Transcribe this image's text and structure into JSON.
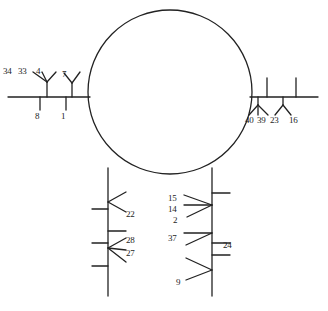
{
  "diagram": {
    "type": "schematic-line-diagram",
    "background_color": "#ffffff",
    "stroke_color": "#222222",
    "text_color": "#1d1d1d",
    "central_shape": {
      "name": "circle",
      "cx": 170,
      "cy": 92,
      "r": 82
    },
    "labels": {
      "left_branch": {
        "fork_upper": [
          "34",
          "33",
          "4"
        ],
        "fork_upper_right": "7",
        "tick_lower_left": "8",
        "tick_lower_right": "1"
      },
      "right_branch": {
        "fork_lower_left": [
          "40",
          "39",
          "23"
        ],
        "fork_lower_right": "16"
      },
      "left_stem": {
        "arrow_top": "22",
        "fork_upper": "28",
        "fork_lower": "27"
      },
      "right_stem": {
        "arrow_top": [
          "15",
          "14",
          "2"
        ],
        "arrow_middle": "37",
        "tick_right": "24",
        "arrow_bottom": "9"
      }
    },
    "label_positions": [
      {
        "name": "label-34",
        "text": "34",
        "x": 3,
        "y": 67
      },
      {
        "name": "label-33",
        "text": "33",
        "x": 18,
        "y": 67
      },
      {
        "name": "label-4",
        "text": "4",
        "x": 36,
        "y": 67
      },
      {
        "name": "label-7",
        "text": "7",
        "x": 62,
        "y": 70
      },
      {
        "name": "label-8",
        "text": "8",
        "x": 35,
        "y": 112
      },
      {
        "name": "label-1",
        "text": "1",
        "x": 61,
        "y": 112
      },
      {
        "name": "label-40",
        "text": "40",
        "x": 245,
        "y": 116
      },
      {
        "name": "label-39",
        "text": "39",
        "x": 257,
        "y": 116
      },
      {
        "name": "label-23",
        "text": "23",
        "x": 270,
        "y": 116
      },
      {
        "name": "label-16",
        "text": "16",
        "x": 289,
        "y": 116
      },
      {
        "name": "label-22",
        "text": "22",
        "x": 126,
        "y": 210
      },
      {
        "name": "label-28",
        "text": "28",
        "x": 126,
        "y": 236
      },
      {
        "name": "label-27",
        "text": "27",
        "x": 126,
        "y": 249
      },
      {
        "name": "label-15",
        "text": "15",
        "x": 168,
        "y": 194
      },
      {
        "name": "label-14",
        "text": "14",
        "x": 168,
        "y": 205
      },
      {
        "name": "label-2",
        "text": "2",
        "x": 173,
        "y": 216
      },
      {
        "name": "label-37",
        "text": "37",
        "x": 168,
        "y": 234
      },
      {
        "name": "label-24",
        "text": "24",
        "x": 223,
        "y": 241
      },
      {
        "name": "label-9",
        "text": "9",
        "x": 176,
        "y": 278
      }
    ]
  }
}
